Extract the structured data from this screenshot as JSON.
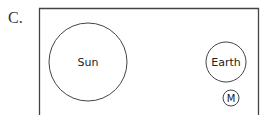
{
  "option_label": "C.",
  "diagram": {
    "bodies": [
      {
        "name": "Sun",
        "cx": 88,
        "cy": 62,
        "r": 39,
        "font_size": 11
      },
      {
        "name": "Earth",
        "cx": 226,
        "cy": 62,
        "r": 20,
        "font_size": 11
      },
      {
        "name": "M",
        "cx": 231,
        "cy": 98,
        "r": 8,
        "font_size": 10
      }
    ],
    "line_color": "#444444"
  }
}
